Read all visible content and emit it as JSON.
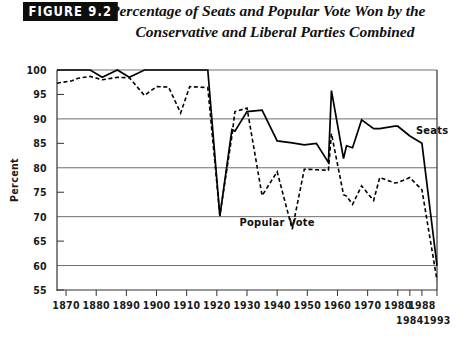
{
  "figure": {
    "badge": "FIGURE 9.2",
    "title_line1": "Percentage of Seats and Popular Vote Won by the",
    "title_line2": "Conservative and Liberal Parties Combined"
  },
  "chart_data": {
    "type": "line",
    "title": "Percentage of Seats and Popular Vote Won by the Conservative and Liberal Parties Combined",
    "xlabel": "",
    "ylabel": "Percent",
    "ylim": [
      55,
      100
    ],
    "xlim": [
      1867,
      1993
    ],
    "ytick_values": [
      55,
      60,
      65,
      70,
      75,
      80,
      85,
      90,
      95,
      100
    ],
    "ytick_labels": [
      "55",
      "60",
      "65",
      "70",
      "75",
      "80",
      "85",
      "90",
      "95",
      "100"
    ],
    "gridlines_y": [
      60,
      70,
      80,
      90,
      100
    ],
    "grid": true,
    "legend_position": "inline-annotation",
    "xtick_values": [
      1870,
      1880,
      1890,
      1900,
      1910,
      1920,
      1930,
      1940,
      1950,
      1960,
      1970,
      1980,
      1984,
      1988,
      1993
    ],
    "xtick_labels_row1": [
      "1870",
      "1880",
      "1890",
      "1900",
      "1910",
      "1920",
      "1930",
      "1940",
      "1950",
      "1960",
      "1970",
      "1980",
      "1988"
    ],
    "xtick_labels_row2": [
      "1984",
      "1993"
    ],
    "annotations": [
      {
        "text": "Seats",
        "x": 1986,
        "y": 87
      },
      {
        "text": "Popular Vote",
        "x": 1940,
        "y": 68
      }
    ],
    "series": [
      {
        "name": "Seats",
        "style": "solid",
        "color": "#000000",
        "x": [
          1867,
          1872,
          1874,
          1878,
          1882,
          1887,
          1891,
          1896,
          1900,
          1904,
          1908,
          1911,
          1917,
          1921,
          1925,
          1926,
          1930,
          1935,
          1940,
          1945,
          1949,
          1953,
          1957,
          1958,
          1962,
          1963,
          1965,
          1968,
          1972,
          1974,
          1979,
          1980,
          1984,
          1988,
          1993
        ],
        "values": [
          100,
          100,
          100,
          100,
          98.5,
          100,
          98.5,
          100,
          100,
          100,
          100,
          100,
          100,
          70.1,
          87.8,
          87.5,
          91.5,
          91.8,
          85.5,
          85.1,
          84.7,
          85.0,
          81.1,
          95.8,
          81.9,
          84.5,
          84.1,
          89.8,
          88.0,
          88.0,
          88.5,
          88.5,
          86.5,
          85.0,
          60.0
        ]
      },
      {
        "name": "Popular Vote",
        "style": "dashed",
        "color": "#000000",
        "x": [
          1867,
          1872,
          1874,
          1878,
          1882,
          1887,
          1891,
          1896,
          1900,
          1904,
          1908,
          1911,
          1917,
          1921,
          1925,
          1926,
          1930,
          1935,
          1940,
          1945,
          1949,
          1953,
          1957,
          1958,
          1962,
          1963,
          1965,
          1968,
          1972,
          1974,
          1979,
          1980,
          1984,
          1988,
          1993
        ],
        "values": [
          97.3,
          97.8,
          98.3,
          98.7,
          98.0,
          98.5,
          98.4,
          94.8,
          96.6,
          96.5,
          91.2,
          96.6,
          96.4,
          70.3,
          86.5,
          91.5,
          92.2,
          74.3,
          79.2,
          67.4,
          79.7,
          79.6,
          79.5,
          87.0,
          74.5,
          74.2,
          72.5,
          76.3,
          73.3,
          78.0,
          76.9,
          77.0,
          78.0,
          75.5,
          57.0
        ]
      }
    ]
  }
}
